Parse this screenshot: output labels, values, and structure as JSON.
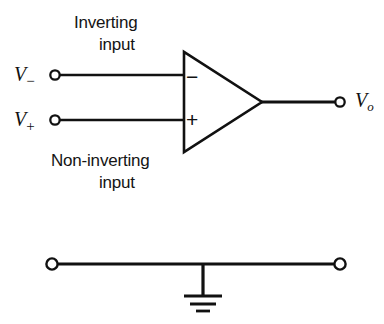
{
  "figure": {
    "background_color": "#ffffff",
    "line_color": "#111111"
  },
  "labels": {
    "inverting_line1": "Inverting",
    "inverting_line2": "input",
    "noninverting_line1": "Non-inverting",
    "noninverting_line2": "input",
    "v_minus_symbol": "V",
    "v_minus_subscript": "−",
    "v_plus_symbol": "V",
    "v_plus_subscript": "+",
    "v_out_symbol": "V",
    "v_out_subscript": "o",
    "terminal_minus_sign": "−",
    "terminal_plus_sign": "+"
  },
  "circuit": {
    "amplifier": {
      "type": "op-amp-triangle",
      "left_x": 183,
      "top_y": 52,
      "bottom_y": 152,
      "apex_x": 262,
      "apex_y": 102
    },
    "terminals": [
      {
        "name": "inverting-input",
        "x": 55,
        "y": 75,
        "r": 5
      },
      {
        "name": "non-inverting-input",
        "x": 55,
        "y": 120,
        "r": 5
      },
      {
        "name": "output",
        "x": 340,
        "y": 102,
        "r": 5
      },
      {
        "name": "ground-rail-left",
        "x": 52,
        "y": 264,
        "r": 6
      },
      {
        "name": "ground-rail-right",
        "x": 340,
        "y": 264,
        "r": 6
      }
    ],
    "wires": [
      {
        "name": "inverting-input-wire",
        "x1": 60,
        "y1": 75,
        "x2": 184,
        "y2": 75
      },
      {
        "name": "non-inverting-input-wire",
        "x1": 60,
        "y1": 120,
        "x2": 184,
        "y2": 120
      },
      {
        "name": "output-wire",
        "x1": 261,
        "y1": 102,
        "x2": 335,
        "y2": 102
      },
      {
        "name": "ground-rail-wire",
        "x1": 58,
        "y1": 264,
        "x2": 334,
        "y2": 264
      },
      {
        "name": "ground-stem-wire",
        "x1": 203,
        "y1": 264,
        "x2": 203,
        "y2": 296
      }
    ],
    "ground_symbol": {
      "stem_x": 203,
      "bars": [
        {
          "y": 296,
          "half_width": 19,
          "thickness": 3
        },
        {
          "y": 304,
          "half_width": 13,
          "thickness": 3
        },
        {
          "y": 311,
          "half_width": 7,
          "thickness": 3
        }
      ]
    }
  }
}
